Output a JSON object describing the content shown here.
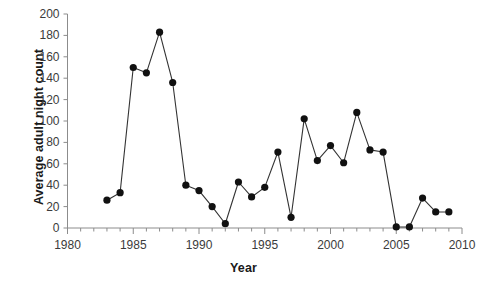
{
  "chart_data": {
    "type": "line",
    "title": "",
    "xlabel": "Year",
    "ylabel": "Average adult night count",
    "xlim": [
      1980,
      2010
    ],
    "ylim": [
      0,
      200
    ],
    "y_tick_step": 20,
    "y_ticks": [
      0,
      20,
      40,
      60,
      80,
      100,
      120,
      140,
      160,
      180,
      200
    ],
    "x_ticks_major": [
      1980,
      1985,
      1990,
      1995,
      2000,
      2005,
      2010
    ],
    "x_minor_tick_interval": 1,
    "grid": false,
    "legend": false,
    "marker": "filled-circle",
    "marker_color": "#111111",
    "line_color": "#333333",
    "x": [
      1983,
      1984,
      1985,
      1986,
      1987,
      1988,
      1989,
      1990,
      1991,
      1992,
      1993,
      1994,
      1995,
      1996,
      1997,
      1998,
      1999,
      2000,
      2001,
      2002,
      2003,
      2004,
      2005,
      2006,
      2007,
      2008,
      2009
    ],
    "values": [
      26,
      33,
      150,
      145,
      183,
      136,
      40,
      35,
      20,
      4,
      43,
      29,
      38,
      71,
      10,
      102,
      63,
      77,
      61,
      108,
      73,
      71,
      1,
      1,
      28,
      15,
      15
    ],
    "series": [
      {
        "name": "Average adult night count",
        "values": [
          26,
          33,
          150,
          145,
          183,
          136,
          40,
          35,
          20,
          4,
          43,
          29,
          38,
          71,
          10,
          102,
          63,
          77,
          61,
          108,
          73,
          71,
          1,
          1,
          28,
          15,
          15
        ]
      }
    ]
  }
}
